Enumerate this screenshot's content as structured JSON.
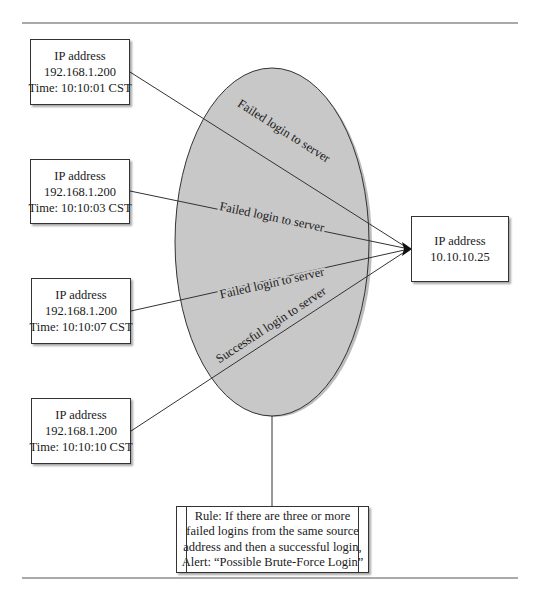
{
  "diagram": {
    "source_nodes": [
      {
        "line1": "IP address",
        "line2": "192.168.1.200",
        "line3": "Time: 10:10:01 CST"
      },
      {
        "line1": "IP address",
        "line2": "192.168.1.200",
        "line3": "Time: 10:10:03 CST"
      },
      {
        "line1": "IP address",
        "line2": "192.168.1.200",
        "line3": "Time: 10:10:07 CST"
      },
      {
        "line1": "IP address",
        "line2": "192.168.1.200",
        "line3": "Time: 10:10:10 CST"
      }
    ],
    "target_node": {
      "line1": "IP address",
      "line2": "10.10.10.25"
    },
    "edges": [
      {
        "label": "Failed login to server"
      },
      {
        "label": "Failed login to server"
      },
      {
        "label": "Failed login to server"
      },
      {
        "label": "Successful login to server"
      }
    ],
    "rule_node": {
      "line1": "Rule: If there are three or more",
      "line2": "failed logins from the same source",
      "line3": "address and then a successful login,",
      "line4": "Alert: “Possible Brute-Force Login”"
    },
    "colors": {
      "ellipse_fill": "#c8c8c8",
      "stroke": "#333333"
    }
  }
}
